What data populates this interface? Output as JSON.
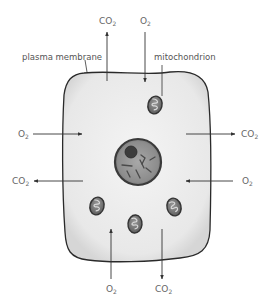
{
  "labels": {
    "plasma_membrane": "plasma membrane",
    "mitochondrion": "mitochondrion"
  },
  "gases": {
    "top_left": {
      "base": "CO",
      "sub": "2",
      "direction": "out"
    },
    "top_right": {
      "base": "O",
      "sub": "2",
      "direction": "in"
    },
    "left_upper": {
      "base": "O",
      "sub": "2",
      "direction": "in"
    },
    "right_upper": {
      "base": "CO",
      "sub": "2",
      "direction": "out"
    },
    "left_lower": {
      "base": "CO",
      "sub": "2",
      "direction": "out"
    },
    "right_lower": {
      "base": "O",
      "sub": "2",
      "direction": "in"
    },
    "bottom_left": {
      "base": "O",
      "sub": "2",
      "direction": "in"
    },
    "bottom_right": {
      "base": "CO",
      "sub": "2",
      "direction": "out"
    }
  },
  "colors": {
    "cytoplasm": "#ececec",
    "outline": "#333333",
    "nucleus_fill": "#8a8a8a",
    "nucleolus": "#3a3a3a",
    "mito_fill": "#7a7a7a",
    "arrow": "#333333",
    "text": "#666666"
  }
}
